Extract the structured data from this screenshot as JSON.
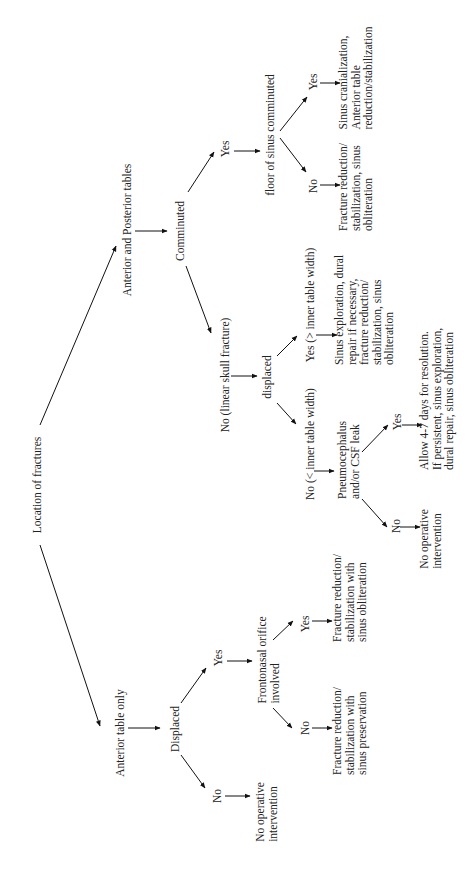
{
  "diagram": {
    "orientation": "rotated-90-ccw",
    "root": "Location of fractures",
    "nodes": {
      "root": "Location of fractures",
      "ap_tables": "Anterior and Posterior tables",
      "ant_only": "Anterior table only",
      "comminuted": "Comminuted",
      "comm_yes": "Yes",
      "floor": "floor of sinus comminuted",
      "floor_no": "No",
      "floor_yes": "Yes",
      "floor_no_result": "Fracture reduction/\nstabilization, sinus\nobliteration",
      "floor_yes_result": "Sinus cranialization,\nAnterior table\nreduction/stabilization",
      "comm_no": "No (linear skull fracture)",
      "displaced_lc": "displaced",
      "disp_yes": "Yes (> inner table width)",
      "disp_no": "No (< inner table width)",
      "disp_yes_result": "Sinus exploration, dural\nrepair if necessary,\nfracture reduction/\nstabilization, sinus\nobliteration",
      "pneumo": "Pneumocephalus\nand/or CSF leak",
      "pneumo_yes": "Yes",
      "pneumo_no": "No",
      "pneumo_yes_result": "Allow 4-7 days for resolution.\nIf persistent, sinus exploration,\ndural repair, sinus obliteration",
      "pneumo_no_result": "No operative\nintervention",
      "displaced": "Displaced",
      "ant_yes": "Yes",
      "ant_no": "No",
      "ant_no_result": "No operative\nintervention",
      "frontonasal": "Frontonasal orifice\ninvolved",
      "fn_yes": "Yes",
      "fn_no": "No",
      "fn_yes_result": "Fracture reduction/\nstabilization with\nsinus obliteration",
      "fn_no_result": "Fracture reduction/\nstabilization with\nsinus preservation"
    }
  }
}
